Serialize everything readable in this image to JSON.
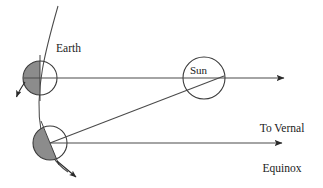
{
  "figure": {
    "kind": "astronomy-orbital-diagram",
    "title_text": "",
    "background_color": "#ffffff",
    "stroke_color": "#3a3a3a",
    "shade_color": "#8c8c8c",
    "width": 323,
    "height": 188
  },
  "labels": {
    "earth": "Earth",
    "sun": "Sun",
    "vernal_line1": "To Vernal",
    "vernal_line2": "Equinox"
  },
  "bodies": {
    "earth_upper": {
      "name": "Earth at first position",
      "cx": 40,
      "cy": 78,
      "r": 17,
      "shaded_side": "left",
      "terminator_angle_deg": 90,
      "fill": "#ffffff",
      "shade_fill": "#8c8c8c"
    },
    "earth_lower": {
      "name": "Earth at second position",
      "cx": 50,
      "cy": 143,
      "r": 17,
      "shaded_side": "left",
      "terminator_angle_deg": 67,
      "fill": "#ffffff",
      "shade_fill": "#8c8c8c"
    },
    "sun": {
      "name": "Sun",
      "cx": 204,
      "cy": 78,
      "r": 21,
      "fill": "#ffffff"
    }
  },
  "lines": {
    "orbit_arc": {
      "name": "orbital path arc",
      "from_x": 58,
      "from_y": 6,
      "to_x": 68,
      "to_y": 170
    },
    "sight_line_upper": {
      "name": "line of sight from upper Earth to vernal equinox",
      "from_x": 24,
      "from_y": 78,
      "to_x": 290,
      "to_y": 78
    },
    "sight_line_lower": {
      "name": "line of sight from lower Earth to vernal equinox",
      "from_x": 50,
      "from_y": 143,
      "to_x": 288,
      "to_y": 143
    },
    "earth_sun_line": {
      "name": "line from lower Earth to Sun",
      "from_x": 50,
      "from_y": 143,
      "to_x": 224,
      "to_y": 76
    }
  },
  "arrows": {
    "rotation_arrow": {
      "name": "Earth rotation direction arrow",
      "tip_x": 16,
      "tip_y": 99,
      "direction": "down-left-curved"
    },
    "axis_arrow_lower": {
      "name": "Earth axis pointer arrow below lower Earth",
      "tip_x": 79,
      "tip_y": 180,
      "direction": "down-right"
    },
    "vernal_arrow_upper": {
      "name": "vernal equinox arrowhead upper",
      "tip_x": 291,
      "tip_y": 78
    },
    "vernal_arrow_lower": {
      "name": "vernal equinox arrowhead lower",
      "tip_x": 289,
      "tip_y": 143
    }
  }
}
